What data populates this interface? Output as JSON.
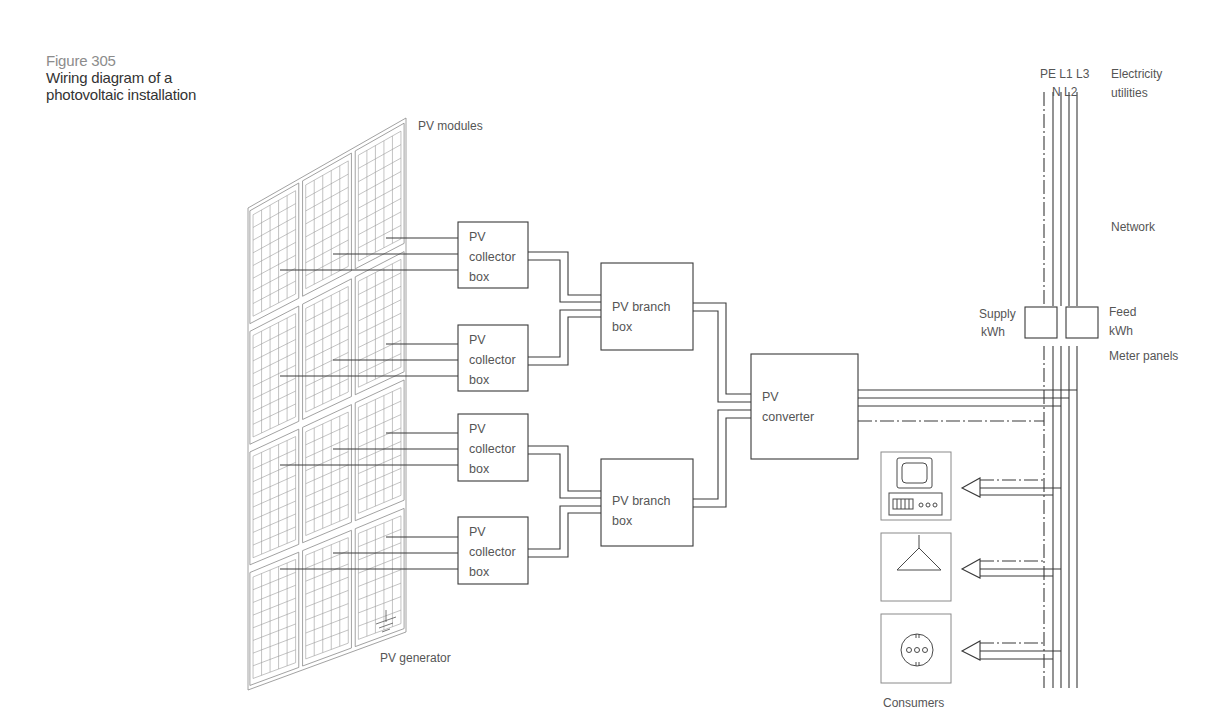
{
  "caption": {
    "figure_label": "Figure 305",
    "title_line1": "Wiring diagram of a",
    "title_line2": "photovoltaic installation"
  },
  "labels": {
    "pv_modules": "PV modules",
    "pv_generator": "PV generator",
    "network": "Network",
    "electricity_utilities_line1": "Electricity",
    "electricity_utilities_line2": "utilities",
    "conductors_top": "PE L1 L3",
    "conductors_bottom": "N L2",
    "meter_panels": "Meter panels",
    "consumers": "Consumers"
  },
  "meters": {
    "supply": {
      "line1": "Supply",
      "line2": "kWh"
    },
    "feed": {
      "line1": "Feed",
      "line2": "kWh"
    }
  },
  "collector_boxes": [
    {
      "line1": "PV",
      "line2": "collector",
      "line3": "box"
    },
    {
      "line1": "PV",
      "line2": "collector",
      "line3": "box"
    },
    {
      "line1": "PV",
      "line2": "collector",
      "line3": "box"
    },
    {
      "line1": "PV",
      "line2": "collector",
      "line3": "box"
    }
  ],
  "branch_boxes": [
    {
      "line1": "PV branch",
      "line2": "box"
    },
    {
      "line1": "PV branch",
      "line2": "box"
    }
  ],
  "converter": {
    "line1": "PV",
    "line2": "converter"
  },
  "consumer_icons": [
    "computer-icon",
    "lamp-icon",
    "socket-icon"
  ],
  "colors": {
    "line": "#3a3a3a",
    "panel_grid": "#8a8a8a",
    "text": "#555555",
    "caption_gray": "#8c8c8c",
    "caption_dark": "#333333"
  }
}
